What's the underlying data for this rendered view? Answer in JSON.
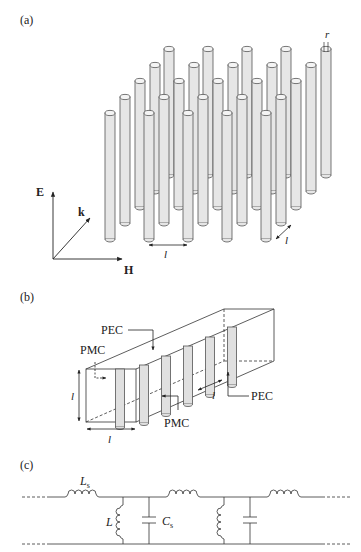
{
  "panels": {
    "a": {
      "label": "(a)",
      "description": "3D array of parallel conducting rods (5 x 5 grid)",
      "rods": {
        "rows": 5,
        "cols": 5,
        "radius_label": "r",
        "spacing_label_x": "l",
        "spacing_label_depth": "l"
      },
      "axes": {
        "e_label": "E",
        "k_label": "k",
        "h_label": "H"
      }
    },
    "b": {
      "label": "(b)",
      "description": "Unit cell waveguide with PEC/PMC boundaries",
      "labels": {
        "pec_top": "PEC",
        "pmc_left": "PMC",
        "pmc_bottom": "PMC",
        "pec_right": "PEC",
        "height": "l",
        "width": "l",
        "period": "l"
      }
    },
    "c": {
      "label": "(c)",
      "description": "Equivalent transmission-line circuit",
      "labels": {
        "series_inductor": "L",
        "series_inductor_sub": "s",
        "shunt_inductor": "L",
        "shunt_capacitor": "C",
        "shunt_capacitor_sub": "s"
      }
    }
  }
}
